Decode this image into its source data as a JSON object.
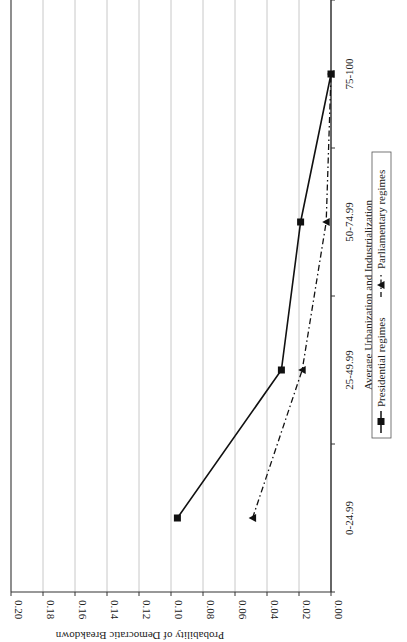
{
  "chart_data": {
    "type": "line",
    "orientation": "rotated-90-clockwise",
    "title": "",
    "xlabel": "Average Urbanization and Industrialization",
    "ylabel": "Probability of Democratic Breakdown",
    "categories": [
      "0-24.99",
      "25-49.99",
      "50-74.99",
      "75-100"
    ],
    "ylim": [
      0,
      0.2
    ],
    "yticks": [
      "0.00",
      "0.02",
      "0.04",
      "0.06",
      "0.08",
      "0.10",
      "0.12",
      "0.14",
      "0.16",
      "0.18",
      "0.20"
    ],
    "grid": true,
    "legend_position": "bottom",
    "series": [
      {
        "name": "Presidential regimes",
        "marker": "square",
        "line": "solid",
        "values": [
          0.096,
          0.031,
          0.019,
          0.0
        ]
      },
      {
        "name": "Parliamentary regimes",
        "marker": "triangle",
        "line": "dash-dot",
        "values": [
          0.049,
          0.018,
          0.003,
          0.0
        ]
      }
    ]
  },
  "axis": {
    "ylabel": "Probability of Democratic Breakdown",
    "xlabel": "Average Urbanization and Industrialization",
    "yticks": [
      "0.20",
      "0.18",
      "0.16",
      "0.14",
      "0.12",
      "0.10",
      "0.08",
      "0.06",
      "0.04",
      "0.02",
      "0.00"
    ],
    "categories": [
      "0-24.99",
      "25-49.99",
      "50-74.99",
      "75-100"
    ]
  },
  "legend": {
    "presidential": "Presidential regimes",
    "parliamentary": "Parliamentary regimes"
  },
  "colors": {
    "line": "#111111",
    "grid": "#c8c8c8",
    "axis": "#333333"
  }
}
